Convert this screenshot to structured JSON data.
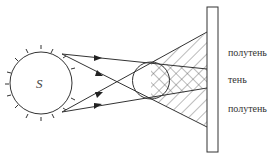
{
  "diagram": {
    "source_label": "S",
    "labels": {
      "penumbra_top": "полутень",
      "umbra": "тень",
      "penumbra_bottom": "полутень"
    }
  }
}
